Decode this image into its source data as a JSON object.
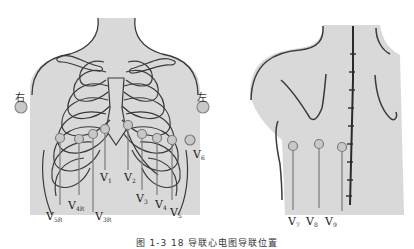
{
  "figure": {
    "caption": "图 1-3  18 导联心电图导联位置",
    "front_view": {
      "side_labels": {
        "right": "右",
        "left": "左"
      },
      "leads": [
        {
          "name": "V",
          "sub": "1"
        },
        {
          "name": "V",
          "sub": "2"
        },
        {
          "name": "V",
          "sub": "3"
        },
        {
          "name": "V",
          "sub": "4"
        },
        {
          "name": "V",
          "sub": "5"
        },
        {
          "name": "V",
          "sub": "6"
        },
        {
          "name": "V",
          "sub": "3R"
        },
        {
          "name": "V",
          "sub": "4R"
        },
        {
          "name": "V",
          "sub": "5R"
        }
      ]
    },
    "back_view": {
      "leads": [
        {
          "name": "V",
          "sub": "7"
        },
        {
          "name": "V",
          "sub": "8"
        },
        {
          "name": "V",
          "sub": "9"
        }
      ]
    },
    "colors": {
      "skin": "#d9d9d9",
      "outline": "#3a3a3a",
      "electrode": "#c8c8c8",
      "electrode_stroke": "#8a8a8a",
      "lead_wire": "#7a7a7a"
    }
  }
}
